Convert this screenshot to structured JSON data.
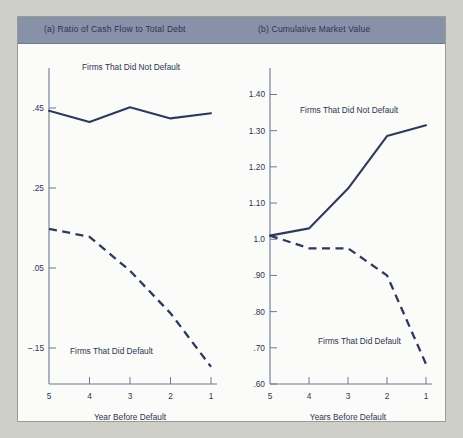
{
  "figure": {
    "panel_a_title": "(a) Ratio of Cash Flow to Total Debt",
    "panel_b_title": "(b) Cumulative Market Value"
  },
  "chart_data": [
    {
      "type": "line",
      "panel": "a",
      "title": "(a) Ratio of Cash Flow to Total Debt",
      "xlabel": "Year Before Default",
      "ylabel": "",
      "x": [
        5,
        4,
        3,
        2,
        1
      ],
      "xticklabels": [
        "5",
        "4",
        "3",
        "2",
        "1"
      ],
      "yticks": [
        0.45,
        0.25,
        0.05,
        -0.15
      ],
      "yticklabels": [
        ".45",
        ".25",
        ".05",
        "–.15"
      ],
      "ylim": [
        -0.24,
        0.52
      ],
      "grid": false,
      "legend_position": "inline-annotation",
      "series": [
        {
          "name": "Firms That Did Not Default",
          "style": "solid",
          "values": [
            0.443,
            0.415,
            0.452,
            0.424,
            0.437
          ],
          "label": "Firms That Did Not Default"
        },
        {
          "name": "Firms That Did Default",
          "style": "dashed",
          "values": [
            0.148,
            0.128,
            0.043,
            -0.063,
            -0.197
          ],
          "label": "Firms That Did Default"
        }
      ]
    },
    {
      "type": "line",
      "panel": "b",
      "title": "(b) Cumulative Market Value",
      "xlabel": "Years Before Default",
      "ylabel": "",
      "x": [
        5,
        4,
        3,
        2,
        1
      ],
      "xticklabels": [
        "5",
        "4",
        "3",
        "2",
        "1"
      ],
      "yticks": [
        1.4,
        1.3,
        1.2,
        1.1,
        1.0,
        0.9,
        0.8,
        0.7,
        0.6
      ],
      "yticklabels": [
        "1.40",
        "1.30",
        "1.20",
        "1.10",
        "1.0",
        ".90",
        ".80",
        ".70",
        ".60"
      ],
      "ylim": [
        0.6,
        1.44
      ],
      "grid": false,
      "legend_position": "inline-annotation",
      "series": [
        {
          "name": "Firms That Did Not Default",
          "style": "solid",
          "values": [
            1.01,
            1.03,
            1.14,
            1.285,
            1.315
          ],
          "label": "Firms That Did Not Default"
        },
        {
          "name": "Firms That Did Default",
          "style": "dashed",
          "values": [
            1.01,
            0.975,
            0.975,
            0.9,
            0.655
          ],
          "label": "Firms That Did Default"
        }
      ]
    }
  ],
  "colors": {
    "band": "#8791a8",
    "ink": "#2b3550",
    "line": "#2e3a5c",
    "paper": "#fbfbf9",
    "page": "#cfcfca"
  }
}
